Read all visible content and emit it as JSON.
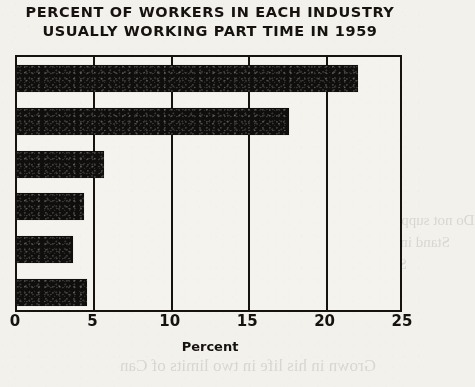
{
  "chart_data": {
    "type": "bar",
    "orientation": "horizontal",
    "title": "PERCENT OF WORKERS IN EACH INDUSTRY USUALLY WORKING PART TIME IN 1959",
    "title_lines": [
      "PERCENT OF WORKERS IN EACH INDUSTRY",
      "USUALLY WORKING PART TIME IN 1959"
    ],
    "xlabel": "Percent",
    "ylabel": "",
    "xlim": [
      0,
      25
    ],
    "xticks": [
      0,
      5,
      10,
      15,
      20,
      25
    ],
    "xtick_labels": [
      "0",
      "5",
      "10",
      "15",
      "20",
      "25"
    ],
    "grid": true,
    "grid_axis": "x",
    "legend": false,
    "categories": [
      "",
      "",
      "",
      "",
      "",
      ""
    ],
    "values": [
      22.0,
      17.6,
      5.6,
      4.3,
      3.6,
      4.5
    ],
    "bar_color": "#100e0c",
    "frame_color": "#16130f",
    "background_color": "#f2f1ec"
  },
  "bleed_through": [
    "es es",
    "over",
    "of The Sometimes",
    "Do not suppress a  anything she  Cons see",
    "Stand in of animal reserved the old",
    "Sweeten ollas somers were",
    "Grown in his life in two limits of Can"
  ]
}
